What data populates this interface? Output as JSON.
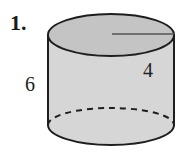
{
  "problem_number": "1.",
  "figure": {
    "shape": "cylinder",
    "height_label": "6",
    "radius_label": "4",
    "colors": {
      "top_fill": "#c4c4c4",
      "side_fill": "#d6d6d6",
      "bottom_fill": "#cfcfcf",
      "stroke": "#1e1e1e",
      "radius_line": "#555555"
    }
  }
}
